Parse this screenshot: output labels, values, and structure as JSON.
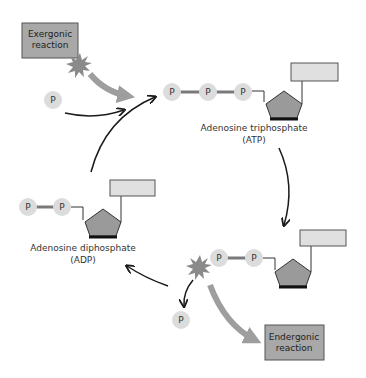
{
  "diagram": {
    "type": "cycle",
    "colors": {
      "phosphate_fill": "#dcdcdc",
      "phosphate_bond": "#7a7a7a",
      "pentagon_fill": "#9a9a9a",
      "pentagon_base": "#111111",
      "base_rect_fill": "#e0e0e0",
      "reaction_box_fill": "#a8a8a8",
      "starburst": "#8a8a8a",
      "energy_arrow": "#9e9e9e",
      "cycle_arrow": "#1a1a1a"
    },
    "phosphate_symbol": "P",
    "exergonic": {
      "line1": "Exergonic",
      "line2": "reaction"
    },
    "endergonic": {
      "line1": "Endergonic",
      "line2": "reaction"
    },
    "atp": {
      "line1": "Adenosine triphosphate",
      "line2": "(ATP)",
      "phosphates": 3
    },
    "adp": {
      "line1": "Adenosine diphosphate",
      "line2": "(ADP)",
      "phosphates": 2
    },
    "free_phosphate_in": "P",
    "free_phosphate_out": "P"
  }
}
